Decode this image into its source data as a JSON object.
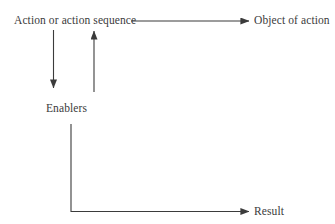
{
  "diagram": {
    "type": "flow-diagram",
    "background_color": "#ffffff",
    "stroke_color": "#3b3b3b",
    "text_color": "#3b3b3b",
    "nodes": [
      {
        "id": "action",
        "label": "Action or action sequence"
      },
      {
        "id": "object",
        "label": "Object of action"
      },
      {
        "id": "enablers",
        "label": "Enablers"
      },
      {
        "id": "result",
        "label": "Result"
      }
    ],
    "edges": [
      {
        "id": "action-to-object",
        "from": "action",
        "to": "object",
        "direction": "right",
        "arrowhead": true
      },
      {
        "id": "action-to-enablers",
        "from": "action",
        "to": "enablers",
        "direction": "down",
        "arrowhead": true
      },
      {
        "id": "enablers-to-action",
        "from": "enablers",
        "to": "action",
        "direction": "up",
        "arrowhead": true
      },
      {
        "id": "enablers-to-result",
        "from": "enablers",
        "to": "result",
        "direction": "down-then-right",
        "arrowhead": true
      }
    ]
  }
}
